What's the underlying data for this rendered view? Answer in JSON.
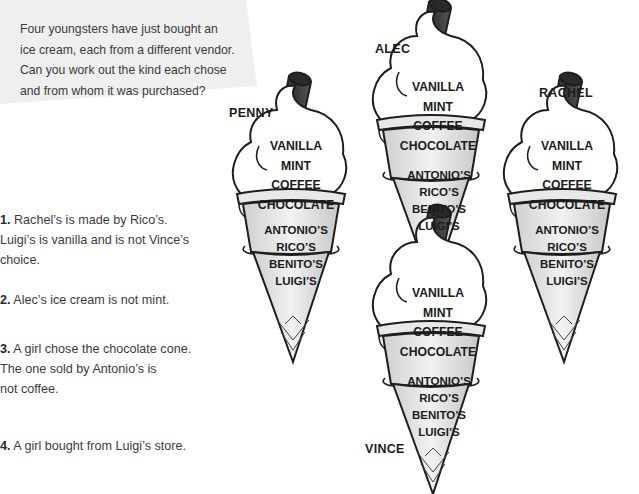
{
  "intro": {
    "lines": [
      "Four youngsters have just bought an",
      "ice cream, each from a different vendor.",
      "Can you work out the kind each chose",
      "and from whom it was purchased?"
    ]
  },
  "clues": [
    {
      "num": "1.",
      "text": " Rachel’s is made by Rico’s. Luigi’s is vanilla and is not Vince’s choice."
    },
    {
      "num": "2.",
      "text": " Alec’s ice cream is not mint."
    },
    {
      "num": "3.",
      "text": " A girl chose the chocolate cone. The one sold by Antonio’s is"
    },
    {
      "num": "",
      "text": "not coffee."
    },
    {
      "num": "4.",
      "text": " A girl bought from Luigi’s store."
    }
  ],
  "flavour_options": [
    "VANILLA",
    "MINT",
    "COFFEE",
    "CHOCOLATE"
  ],
  "vendor_options": [
    "ANTONIO’S",
    "RICO’S",
    "BENITO’S",
    "LUIGI’S"
  ],
  "cones": [
    {
      "name": "PENNY"
    },
    {
      "name": "ALEC"
    },
    {
      "name": "RACHEL"
    },
    {
      "name": "VINCE"
    }
  ],
  "colors": {
    "intro_bg": "#efefef",
    "flake": "#3a3a3a",
    "cone": "#dcdcdc",
    "outline": "#1e1e1e"
  }
}
